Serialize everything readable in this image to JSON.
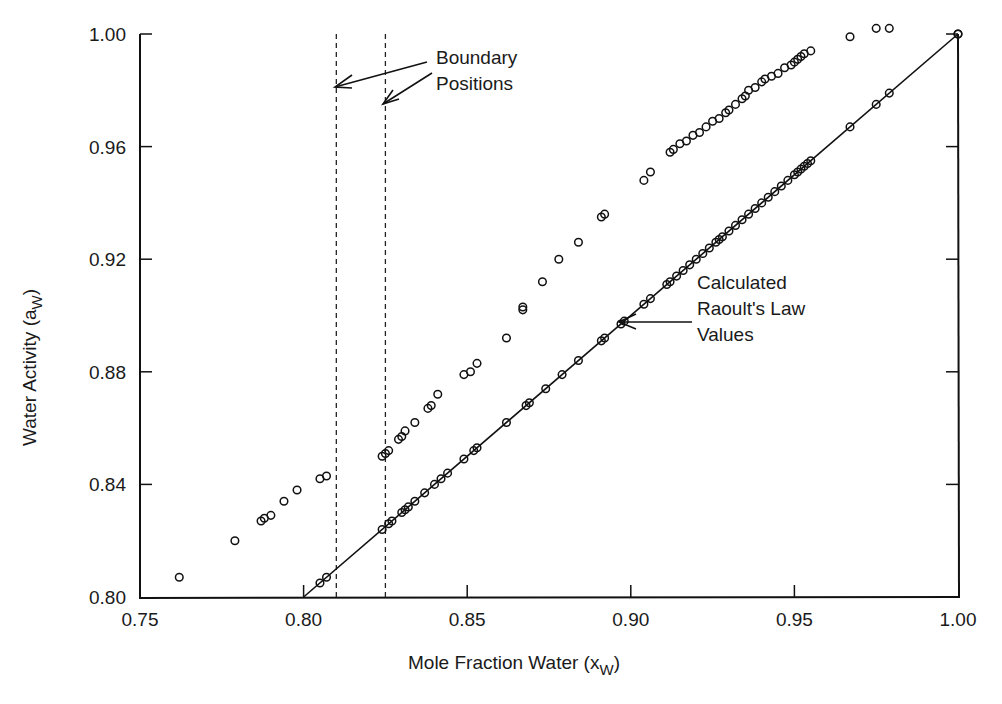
{
  "chart_data": {
    "type": "scatter",
    "title": "",
    "xlabel": "Mole Fraction Water (x",
    "xlabel_sub": "W",
    "ylabel": "Water Activity (a",
    "ylabel_sub": "W",
    "xlim": [
      0.75,
      1.0
    ],
    "ylim": [
      0.8,
      1.0
    ],
    "x_ticks": [
      "0.75",
      "0.80",
      "0.85",
      "0.90",
      "0.95",
      "1.00"
    ],
    "y_ticks": [
      "0.80",
      "0.84",
      "0.88",
      "0.92",
      "0.96",
      "1.00"
    ],
    "grid": false,
    "legend": null,
    "series": [
      {
        "name": "Measured water activity",
        "marker": "open-circle",
        "x": [
          0.762,
          0.779,
          0.787,
          0.788,
          0.79,
          0.794,
          0.798,
          0.805,
          0.807,
          0.824,
          0.825,
          0.826,
          0.829,
          0.83,
          0.831,
          0.834,
          0.838,
          0.839,
          0.841,
          0.849,
          0.851,
          0.853,
          0.862,
          0.867,
          0.867,
          0.873,
          0.878,
          0.884,
          0.891,
          0.892,
          0.904,
          0.906,
          0.912,
          0.913,
          0.915,
          0.917,
          0.919,
          0.921,
          0.923,
          0.925,
          0.927,
          0.929,
          0.93,
          0.932,
          0.934,
          0.935,
          0.936,
          0.938,
          0.94,
          0.941,
          0.943,
          0.945,
          0.947,
          0.949,
          0.95,
          0.951,
          0.952,
          0.953,
          0.955,
          0.967,
          0.975,
          0.979,
          1.0
        ],
        "y": [
          0.807,
          0.82,
          0.827,
          0.828,
          0.829,
          0.834,
          0.838,
          0.842,
          0.843,
          0.85,
          0.851,
          0.852,
          0.856,
          0.857,
          0.859,
          0.862,
          0.867,
          0.868,
          0.872,
          0.879,
          0.88,
          0.883,
          0.892,
          0.902,
          0.903,
          0.912,
          0.92,
          0.926,
          0.935,
          0.936,
          0.948,
          0.951,
          0.958,
          0.959,
          0.961,
          0.962,
          0.964,
          0.965,
          0.967,
          0.969,
          0.97,
          0.972,
          0.973,
          0.975,
          0.977,
          0.978,
          0.98,
          0.981,
          0.983,
          0.984,
          0.985,
          0.986,
          0.988,
          0.989,
          0.99,
          0.991,
          0.992,
          0.993,
          0.994,
          0.999,
          1.002,
          1.002,
          1.0
        ]
      },
      {
        "name": "Calculated Raoult's Law values",
        "marker": "circle-on-line",
        "x": [
          0.805,
          0.807,
          0.824,
          0.826,
          0.827,
          0.83,
          0.831,
          0.832,
          0.834,
          0.837,
          0.84,
          0.842,
          0.844,
          0.849,
          0.852,
          0.853,
          0.862,
          0.868,
          0.869,
          0.874,
          0.879,
          0.884,
          0.891,
          0.892,
          0.897,
          0.898,
          0.904,
          0.906,
          0.911,
          0.912,
          0.914,
          0.916,
          0.918,
          0.92,
          0.922,
          0.924,
          0.926,
          0.927,
          0.928,
          0.93,
          0.932,
          0.934,
          0.936,
          0.938,
          0.94,
          0.942,
          0.944,
          0.946,
          0.948,
          0.95,
          0.951,
          0.952,
          0.953,
          0.954,
          0.955,
          0.967,
          0.975,
          0.979,
          1.0
        ],
        "y": [
          0.805,
          0.807,
          0.824,
          0.826,
          0.827,
          0.83,
          0.831,
          0.832,
          0.834,
          0.837,
          0.84,
          0.842,
          0.844,
          0.849,
          0.852,
          0.853,
          0.862,
          0.868,
          0.869,
          0.874,
          0.879,
          0.884,
          0.891,
          0.892,
          0.897,
          0.898,
          0.904,
          0.906,
          0.911,
          0.912,
          0.914,
          0.916,
          0.918,
          0.92,
          0.922,
          0.924,
          0.926,
          0.927,
          0.928,
          0.93,
          0.932,
          0.934,
          0.936,
          0.938,
          0.94,
          0.942,
          0.944,
          0.946,
          0.948,
          0.95,
          0.951,
          0.952,
          0.953,
          0.954,
          0.955,
          0.967,
          0.975,
          0.979,
          1.0
        ]
      }
    ],
    "reference_line": {
      "name": "Raoult's Law line (a_w = x_w)",
      "from": [
        0.8,
        0.8
      ],
      "to": [
        1.0,
        1.0
      ]
    },
    "boundary_lines": [
      0.81,
      0.825
    ],
    "annotations": [
      {
        "text_lines": [
          "Boundary",
          "Positions"
        ],
        "points_to": "dashed boundary lines at x≈0.810 and x≈0.825"
      },
      {
        "text_lines": [
          "Calculated",
          "Raoult's Law",
          "Values"
        ],
        "points_to": [
          0.893,
          0.896
        ]
      }
    ]
  }
}
